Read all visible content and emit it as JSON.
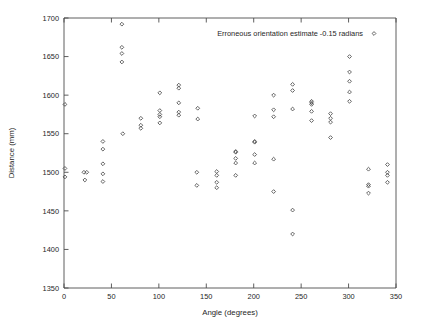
{
  "chart_data": {
    "type": "scatter",
    "title": "",
    "xlabel": "Angle (degrees)",
    "ylabel": "Distance (mm)",
    "xlim": [
      0,
      350
    ],
    "ylim": [
      1350,
      1700
    ],
    "xticks": [
      0,
      50,
      100,
      150,
      200,
      250,
      300,
      350
    ],
    "yticks": [
      1350,
      1400,
      1450,
      1500,
      1550,
      1600,
      1650,
      1700
    ],
    "xtick_labels": [
      "0",
      "50",
      "100",
      "150",
      "200",
      "250",
      "300",
      "350"
    ],
    "ytick_labels": [
      "1350",
      "1400",
      "1450",
      "1500",
      "1550",
      "1600",
      "1650",
      "1700"
    ],
    "grid": false,
    "legend_position": "top-right",
    "marker": "open-diamond",
    "marker_color": "#4a4a4a",
    "series": [
      {
        "name": "Erroneous orientation estimate -0.15 radians",
        "points": [
          [
            1,
            1588
          ],
          [
            1,
            1505
          ],
          [
            1,
            1494
          ],
          [
            21,
            1500
          ],
          [
            24,
            1500
          ],
          [
            22,
            1490
          ],
          [
            41,
            1540
          ],
          [
            41,
            1530
          ],
          [
            41,
            1511
          ],
          [
            41,
            1498
          ],
          [
            41,
            1488
          ],
          [
            61,
            1692
          ],
          [
            61,
            1662
          ],
          [
            61,
            1654
          ],
          [
            61,
            1643
          ],
          [
            62,
            1550
          ],
          [
            81,
            1570
          ],
          [
            81,
            1561
          ],
          [
            81,
            1557
          ],
          [
            101,
            1603
          ],
          [
            101,
            1580
          ],
          [
            101,
            1575
          ],
          [
            101,
            1572
          ],
          [
            101,
            1564
          ],
          [
            121,
            1613
          ],
          [
            121,
            1609
          ],
          [
            121,
            1590
          ],
          [
            121,
            1578
          ],
          [
            121,
            1574
          ],
          [
            141,
            1583
          ],
          [
            141,
            1569
          ],
          [
            140,
            1500
          ],
          [
            140,
            1483
          ],
          [
            161,
            1501
          ],
          [
            161,
            1496
          ],
          [
            161,
            1487
          ],
          [
            161,
            1480
          ],
          [
            181,
            1527
          ],
          [
            181,
            1526
          ],
          [
            181,
            1518
          ],
          [
            181,
            1512
          ],
          [
            181,
            1496
          ],
          [
            201,
            1573
          ],
          [
            201,
            1540
          ],
          [
            201,
            1539
          ],
          [
            201,
            1523
          ],
          [
            201,
            1512
          ],
          [
            221,
            1600
          ],
          [
            221,
            1581
          ],
          [
            221,
            1572
          ],
          [
            221,
            1517
          ],
          [
            221,
            1475
          ],
          [
            241,
            1614
          ],
          [
            241,
            1606
          ],
          [
            241,
            1582
          ],
          [
            241,
            1451
          ],
          [
            241,
            1420
          ],
          [
            261,
            1592
          ],
          [
            261,
            1590
          ],
          [
            261,
            1588
          ],
          [
            261,
            1579
          ],
          [
            261,
            1567
          ],
          [
            281,
            1576
          ],
          [
            281,
            1570
          ],
          [
            281,
            1565
          ],
          [
            281,
            1545
          ],
          [
            301,
            1650
          ],
          [
            301,
            1630
          ],
          [
            301,
            1618
          ],
          [
            301,
            1604
          ],
          [
            301,
            1592
          ],
          [
            321,
            1504
          ],
          [
            321,
            1484
          ],
          [
            321,
            1482
          ],
          [
            321,
            1473
          ],
          [
            341,
            1510
          ],
          [
            341,
            1500
          ],
          [
            341,
            1496
          ],
          [
            341,
            1487
          ]
        ]
      }
    ]
  },
  "legend": {
    "entries": [
      {
        "label": "Erroneous orientation estimate -0.15 radians",
        "marker": "open-diamond"
      }
    ]
  },
  "axes": {
    "x_title": "Angle (degrees)",
    "y_title": "Distance (mm)"
  }
}
